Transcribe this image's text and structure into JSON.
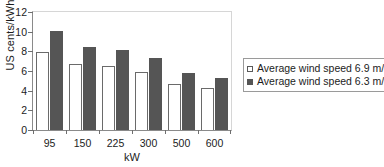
{
  "chart_data": {
    "type": "bar",
    "title": "",
    "subtitle": "",
    "xlabel": "kW",
    "ylabel": "US cents/kWh",
    "categories": [
      "95",
      "150",
      "225",
      "300",
      "500",
      "600"
    ],
    "ylim": [
      0,
      12
    ],
    "yticks": [
      "0",
      "2",
      "4",
      "6",
      "8",
      "10",
      "12"
    ],
    "grid": false,
    "legend_position": "right",
    "series": [
      {
        "name": "Average wind speed 6.9 m/s",
        "color": "#ffffff",
        "marker": "open-square",
        "values": [
          7.9,
          6.75,
          6.5,
          5.85,
          4.65,
          4.3
        ]
      },
      {
        "name": "Average wind speed 6.3 m/s",
        "color": "#555555",
        "marker": "filled-square",
        "values": [
          10.1,
          8.4,
          8.15,
          7.35,
          5.75,
          5.3
        ]
      }
    ]
  },
  "legend": {
    "entries": [
      "Average wind speed 6.9 m/s",
      "Average wind speed 6.3 m/s"
    ]
  },
  "axes": {
    "y_title": "US cents/kWh",
    "x_title": "kW"
  },
  "colors": {
    "series_light": "#ffffff",
    "series_dark": "#555555",
    "axis": "#8a8a8a",
    "frame": "#d6d6d6",
    "text": "#1c1c1c"
  }
}
